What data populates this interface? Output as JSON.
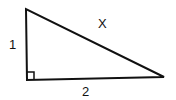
{
  "diagram": {
    "type": "right-triangle",
    "vertices": {
      "top": [
        26,
        9
      ],
      "right_angle": [
        27,
        80
      ],
      "right": [
        164,
        77
      ]
    },
    "labels": {
      "vertical_leg": "1",
      "hypotenuse": "X",
      "horizontal_leg": "2"
    },
    "right_angle_marker": true,
    "stroke_color": "#111111"
  }
}
